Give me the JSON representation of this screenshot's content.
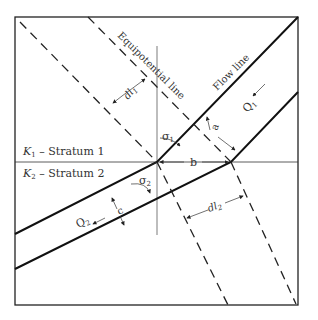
{
  "diagram": {
    "strata": [
      {
        "k_label": "K",
        "k_sub": "1",
        "name": " – Stratum 1"
      },
      {
        "k_label": "K",
        "k_sub": "2",
        "name": " – Stratum 2"
      }
    ],
    "lines": {
      "equipotential": "Equipotential line",
      "flow": "Flow line"
    },
    "symbols": {
      "q1": "Q",
      "q1_sub": "1",
      "q2": "Q",
      "q2_sub": "2",
      "sigma1": "σ",
      "sigma1_sub": "1",
      "sigma2": "σ",
      "sigma2_sub": "2",
      "a": "a",
      "b": "b",
      "c": "c",
      "dl1": "dl",
      "dl1_sub": "1",
      "dl2": "dl",
      "dl2_sub": "2"
    }
  }
}
